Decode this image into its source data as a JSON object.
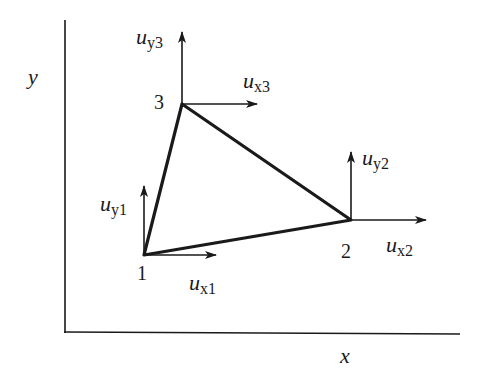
{
  "diagram": {
    "axes": {
      "x_label": "x",
      "y_label": "y"
    },
    "nodes": [
      {
        "id": "1",
        "label": "1",
        "x": 144,
        "y": 255
      },
      {
        "id": "2",
        "label": "2",
        "x": 351,
        "y": 220
      },
      {
        "id": "3",
        "label": "3",
        "x": 182,
        "y": 104
      }
    ],
    "displacements": [
      {
        "node": "1",
        "x_label": {
          "base": "u",
          "sub": "x1"
        },
        "y_label": {
          "base": "u",
          "sub": "y1"
        }
      },
      {
        "node": "2",
        "x_label": {
          "base": "u",
          "sub": "x2"
        },
        "y_label": {
          "base": "u",
          "sub": "y2"
        }
      },
      {
        "node": "3",
        "x_label": {
          "base": "u",
          "sub": "x3"
        },
        "y_label": {
          "base": "u",
          "sub": "y3"
        }
      }
    ],
    "colors": {
      "line": "#1a1a1a",
      "background": "#ffffff"
    }
  }
}
